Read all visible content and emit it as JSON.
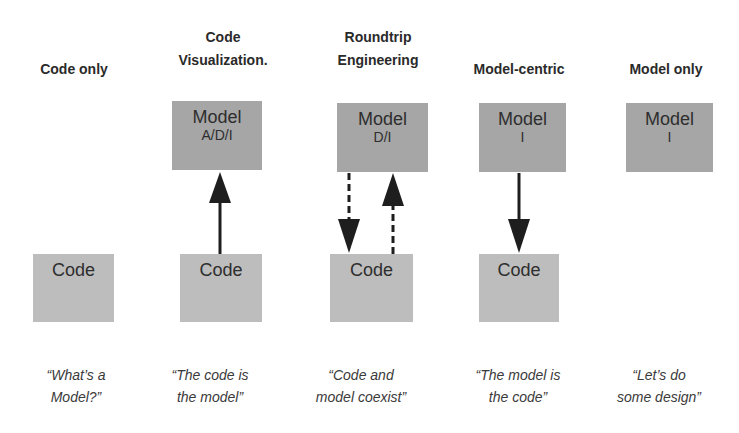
{
  "columns": [
    {
      "id": "code-only",
      "heading": [
        "",
        "Code only"
      ],
      "model": null,
      "code": "Code",
      "arrow": "none",
      "quote": [
        "“What’s a",
        "Model?”"
      ]
    },
    {
      "id": "code-visualization",
      "heading": [
        "Code",
        "Visualization."
      ],
      "model": {
        "label": "Model",
        "sub": "A/D/I"
      },
      "code": "Code",
      "arrow": "code-to-model (solid)",
      "quote": [
        "“The code is",
        "the model”"
      ]
    },
    {
      "id": "roundtrip-engineering",
      "heading": [
        "Roundtrip",
        "Engineering"
      ],
      "model": {
        "label": "Model",
        "sub": "D/I"
      },
      "code": "Code",
      "arrow": "bidirectional (dashed)",
      "quote": [
        "“Code and",
        "model coexist”"
      ]
    },
    {
      "id": "model-centric",
      "heading": [
        "",
        "Model-centric"
      ],
      "model": {
        "label": "Model",
        "sub": "I"
      },
      "code": "Code",
      "arrow": "model-to-code (solid)",
      "quote": [
        "“The model is",
        "the code”"
      ]
    },
    {
      "id": "model-only",
      "heading": [
        "",
        "Model only"
      ],
      "model": {
        "label": "Model",
        "sub": "I"
      },
      "code": null,
      "arrow": "none",
      "quote": [
        "“Let’s do",
        "some design”"
      ]
    }
  ],
  "colors": {
    "model_box": "#a6a6a6",
    "code_box": "#bdbdbd",
    "arrow": "#1e1e1e",
    "text": "#2a2a2a"
  }
}
